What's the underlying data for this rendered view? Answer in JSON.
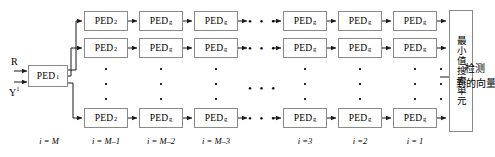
{
  "diagram": {
    "colors": {
      "box_border": "#8a8a8a",
      "line": "#1a1a1a",
      "text": "#000000",
      "background": "#ffffff"
    },
    "inputs": [
      {
        "name": "input-r",
        "label": "R"
      },
      {
        "name": "input-y",
        "label": "Y",
        "superscript": "1"
      }
    ],
    "first_stage": {
      "label": "PED",
      "subscript": "1"
    },
    "rows": [
      {
        "row": 1,
        "cells": [
          {
            "label": "PED",
            "subscript": "2"
          },
          {
            "label": "PED",
            "subscript": "g"
          },
          {
            "label": "PED",
            "subscript": "g"
          },
          {
            "label": "PED",
            "subscript": "g"
          },
          {
            "label": "PED",
            "subscript": "g"
          },
          {
            "label": "PED",
            "subscript": "g"
          }
        ]
      },
      {
        "row": 2,
        "cells": [
          {
            "label": "PED",
            "subscript": "2"
          },
          {
            "label": "PED",
            "subscript": "g"
          },
          {
            "label": "PED",
            "subscript": "g"
          },
          {
            "label": "PED",
            "subscript": "g"
          },
          {
            "label": "PED",
            "subscript": "g"
          },
          {
            "label": "PED",
            "subscript": "g"
          }
        ]
      },
      {
        "row": 3,
        "cells": [
          {
            "label": "PED",
            "subscript": "2"
          },
          {
            "label": "PED",
            "subscript": "g"
          },
          {
            "label": "PED",
            "subscript": "g"
          },
          {
            "label": "PED",
            "subscript": "g"
          },
          {
            "label": "PED",
            "subscript": "g"
          },
          {
            "label": "PED",
            "subscript": "g"
          }
        ]
      }
    ],
    "ellipsis": {
      "horizontal": "• • •",
      "vertical_dots": 3
    },
    "search_unit": {
      "label": "最小值搜索单元"
    },
    "output": {
      "line1": "检测",
      "line2": "到的向量"
    },
    "index_labels": [
      {
        "text": "i = M"
      },
      {
        "text": "i = M–1"
      },
      {
        "text": "i = M–2"
      },
      {
        "text": "i = M–3"
      },
      {
        "text": "i =3"
      },
      {
        "text": "i =2"
      },
      {
        "text": "i = 1"
      }
    ]
  }
}
